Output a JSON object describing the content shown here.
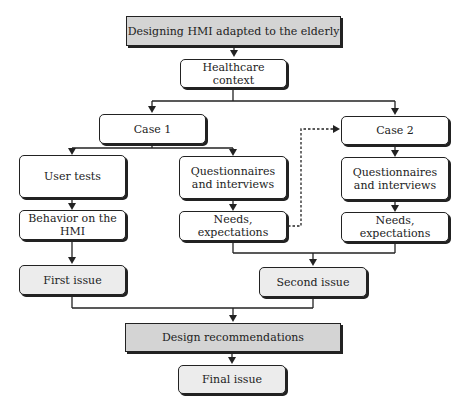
{
  "diagram": {
    "title": "Designing HMI adapted to the elderly",
    "nodes": {
      "root": "Designing HMI adapted to the elderly",
      "context": "Healthcare context",
      "case1": "Case 1",
      "case2": "Case 2",
      "user_tests": "User tests",
      "q1_line1": "Questionnaires",
      "q1_line2": "and interviews",
      "q2_line1": "Questionnaires",
      "q2_line2": "and interviews",
      "behavior": "Behavior on the HMI",
      "needs1": "Needs, expectations",
      "needs2": "Needs, expectations",
      "first_issue": "First issue",
      "second_issue": "Second issue",
      "design_rec": "Design recommendations",
      "final_issue": "Final issue"
    },
    "edges": [
      {
        "from": "root",
        "to": "context",
        "style": "solid"
      },
      {
        "from": "context",
        "to": "case1",
        "style": "solid"
      },
      {
        "from": "context",
        "to": "case2",
        "style": "solid"
      },
      {
        "from": "case1",
        "to": "user_tests",
        "style": "solid"
      },
      {
        "from": "case1",
        "to": "q1",
        "style": "solid"
      },
      {
        "from": "user_tests",
        "to": "behavior",
        "style": "solid"
      },
      {
        "from": "q1",
        "to": "needs1",
        "style": "solid"
      },
      {
        "from": "needs1",
        "to": "case2",
        "style": "dashed"
      },
      {
        "from": "case2",
        "to": "q2",
        "style": "solid"
      },
      {
        "from": "q2",
        "to": "needs2",
        "style": "solid"
      },
      {
        "from": "behavior",
        "to": "first_issue",
        "style": "solid"
      },
      {
        "from": "needs1",
        "to": "second_issue",
        "style": "solid"
      },
      {
        "from": "needs2",
        "to": "second_issue",
        "style": "solid"
      },
      {
        "from": "first_issue",
        "to": "design_rec",
        "style": "solid"
      },
      {
        "from": "second_issue",
        "to": "design_rec",
        "style": "solid"
      },
      {
        "from": "design_rec",
        "to": "final_issue",
        "style": "solid"
      }
    ],
    "colors": {
      "dark_fill": "#d4d4d4",
      "light_fill": "#ececec",
      "stroke": "#222222"
    }
  }
}
